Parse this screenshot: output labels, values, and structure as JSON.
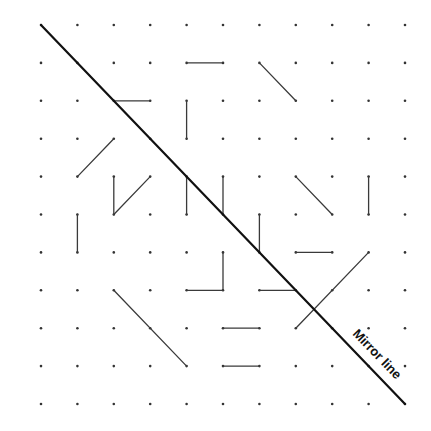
{
  "diagram": {
    "title": "",
    "grid": {
      "cols": 11,
      "rows": 11,
      "origin_x": 41,
      "origin_y": 25,
      "step_x": 36.4,
      "step_y": 37.9,
      "dot_radius": 1.3
    },
    "mirror_line": {
      "label": "Mirror line",
      "from": [
        0,
        0
      ],
      "to": [
        10,
        10
      ],
      "label_x": 374,
      "label_y": 357,
      "label_angle": 46
    },
    "segments": [
      {
        "from": [
          4,
          1
        ],
        "to": [
          5,
          1
        ]
      },
      {
        "from": [
          6,
          1
        ],
        "to": [
          7,
          2
        ]
      },
      {
        "from": [
          2,
          2
        ],
        "to": [
          3,
          2
        ]
      },
      {
        "from": [
          4,
          2
        ],
        "to": [
          4,
          3
        ]
      },
      {
        "from": [
          1,
          4
        ],
        "to": [
          2,
          3
        ]
      },
      {
        "from": [
          2,
          4
        ],
        "to": [
          2,
          5
        ]
      },
      {
        "from": [
          2,
          5
        ],
        "to": [
          3,
          4
        ]
      },
      {
        "from": [
          4,
          4
        ],
        "to": [
          4,
          5
        ]
      },
      {
        "from": [
          5,
          4
        ],
        "to": [
          5,
          5
        ]
      },
      {
        "from": [
          7,
          4
        ],
        "to": [
          8,
          5
        ]
      },
      {
        "from": [
          9,
          4
        ],
        "to": [
          9,
          5
        ]
      },
      {
        "from": [
          1,
          5
        ],
        "to": [
          1,
          6
        ]
      },
      {
        "from": [
          6,
          5
        ],
        "to": [
          6,
          6
        ]
      },
      {
        "from": [
          7,
          6
        ],
        "to": [
          8,
          6
        ]
      },
      {
        "from": [
          5,
          6
        ],
        "to": [
          5,
          7
        ]
      },
      {
        "from": [
          4,
          7
        ],
        "to": [
          5,
          7
        ]
      },
      {
        "from": [
          6,
          7
        ],
        "to": [
          7,
          7
        ]
      },
      {
        "from": [
          9,
          6
        ],
        "to": [
          7,
          8
        ]
      },
      {
        "from": [
          2,
          7
        ],
        "to": [
          4,
          9
        ]
      },
      {
        "from": [
          5,
          8
        ],
        "to": [
          6,
          8
        ]
      },
      {
        "from": [
          5,
          9
        ],
        "to": [
          6,
          9
        ]
      }
    ]
  }
}
